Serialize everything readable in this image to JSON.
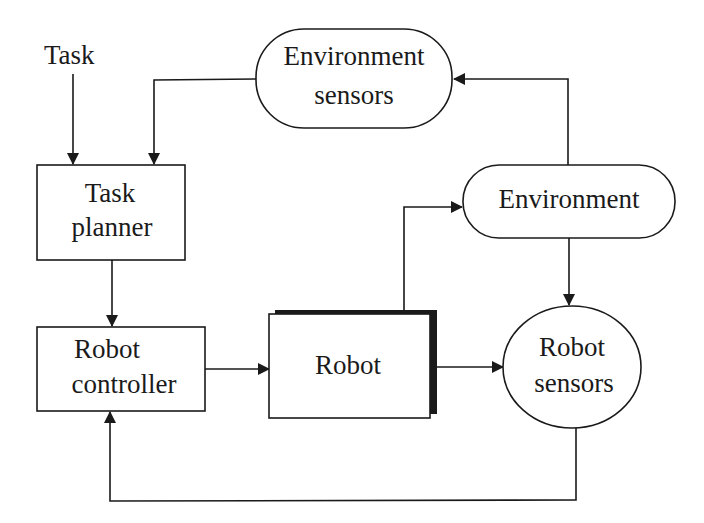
{
  "diagram": {
    "input_label": "Task",
    "nodes": {
      "environment_sensors": {
        "line1": "Environment",
        "line2": "sensors",
        "shape": "rounded-capsule"
      },
      "task_planner": {
        "line1": "Task",
        "line2": "planner",
        "shape": "rectangle"
      },
      "robot_controller": {
        "line1": "Robot",
        "line2": "controller",
        "shape": "rectangle"
      },
      "robot": {
        "line1": "Robot",
        "shape": "rectangle-with-shadow"
      },
      "environment": {
        "line1": "Environment",
        "shape": "rounded-capsule"
      },
      "robot_sensors": {
        "line1": "Robot",
        "line2": "sensors",
        "shape": "ellipse"
      }
    },
    "edges": [
      {
        "from": "Task",
        "to": "Task planner"
      },
      {
        "from": "Environment sensors",
        "to": "Task planner"
      },
      {
        "from": "Task planner",
        "to": "Robot controller"
      },
      {
        "from": "Robot controller",
        "to": "Robot"
      },
      {
        "from": "Robot",
        "to": "Environment"
      },
      {
        "from": "Robot",
        "to": "Robot sensors"
      },
      {
        "from": "Environment",
        "to": "Environment sensors"
      },
      {
        "from": "Environment",
        "to": "Robot sensors"
      },
      {
        "from": "Robot sensors",
        "to": "Robot controller"
      }
    ],
    "colors": {
      "stroke": "#1a1a1a",
      "background": "#ffffff"
    }
  }
}
